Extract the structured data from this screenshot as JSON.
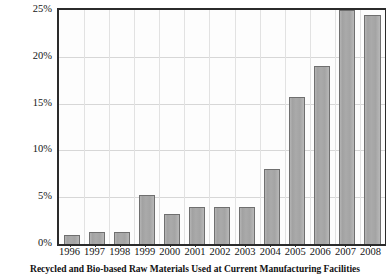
{
  "chart_data": {
    "type": "bar",
    "title": "",
    "xlabel": "",
    "ylabel": "",
    "ylim": [
      0,
      25
    ],
    "ytick_labels": [
      "0%",
      "5%",
      "10%",
      "15%",
      "20%",
      "25%"
    ],
    "ytick_values": [
      0,
      5,
      10,
      15,
      20,
      25
    ],
    "grid": true,
    "legend": "none",
    "categories": [
      "1996",
      "1997",
      "1998",
      "1999",
      "2000",
      "2001",
      "2002",
      "2003",
      "2004",
      "2005",
      "2006",
      "2007",
      "2008"
    ],
    "values": [
      1.0,
      1.3,
      1.3,
      5.2,
      3.2,
      4.0,
      4.0,
      4.0,
      8.0,
      15.7,
      19.0,
      25.0,
      24.5
    ],
    "value_labels": [
      "1%",
      "1.3%",
      "1.3%",
      "5.2%",
      "3.2%",
      "4%",
      "4%",
      "4%",
      "8%",
      "15.7%",
      "19%",
      "25%",
      "24.5%"
    ],
    "bar_color": "#a8a8a8",
    "bar_border_color": "#6f6f6f",
    "grid_color": "#d7d7d7",
    "axis_color": "#2b2b2b",
    "background": "#ffffff"
  },
  "caption": {
    "text": "Recycled and Bio-based Raw Materials Used at Current Manufacturing Facilities"
  }
}
